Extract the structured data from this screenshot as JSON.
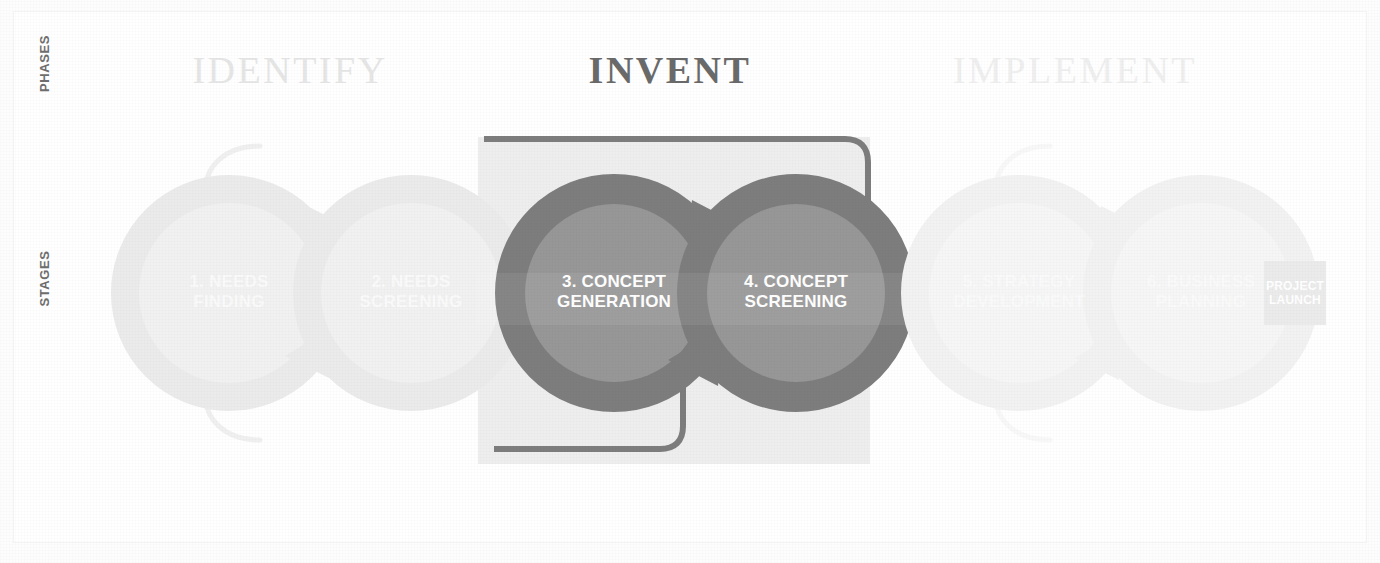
{
  "diagram": {
    "axis_labels": {
      "phases": "PHASES",
      "stages": "STAGES"
    },
    "phases": [
      {
        "id": "identify",
        "title": "IDENTIFY",
        "state": "faded",
        "color": "#e6e6e6"
      },
      {
        "id": "invent",
        "title": "INVENT",
        "state": "highlighted",
        "color": "#6a6a6a",
        "panel_color": "#eeeeee"
      },
      {
        "id": "implement",
        "title": "IMPLEMENT",
        "state": "faded",
        "color": "#efefef"
      }
    ],
    "stages": [
      {
        "number": "1.",
        "line1": "1. NEEDS",
        "line2": "FINDING",
        "phase": "identify",
        "ring_color": "#ebebeb",
        "disc_color": "#f1f1f1"
      },
      {
        "number": "2.",
        "line1": "2. NEEDS",
        "line2": "SCREENING",
        "phase": "identify",
        "ring_color": "#ebebeb",
        "disc_color": "#f1f1f1"
      },
      {
        "number": "3.",
        "line1": "3. CONCEPT",
        "line2": "GENERATION",
        "phase": "invent",
        "ring_color": "#7d7d7d",
        "disc_color": "#979797"
      },
      {
        "number": "4.",
        "line1": "4. CONCEPT",
        "line2": "SCREENING",
        "phase": "invent",
        "ring_color": "#7d7d7d",
        "disc_color": "#979797"
      },
      {
        "number": "5.",
        "line1": "5. STRATEGY",
        "line2": "DEVELOPMENT",
        "phase": "implement",
        "ring_color": "#f2f2f2",
        "disc_color": "#f6f6f6"
      },
      {
        "number": "6.",
        "line1": "6. BUSINESS",
        "line2": "PLANNING",
        "phase": "implement",
        "ring_color": "#f2f2f2",
        "disc_color": "#f6f6f6"
      }
    ],
    "project_launch": {
      "line1": "PROJECT",
      "line2": "LAUNCH",
      "box_color": "#ebebeb",
      "text_color": "#ffffff"
    },
    "connectors": {
      "identify_loop_color": "#f0f0f0",
      "invent_loop_color": "#7d7d7d",
      "implement_loop_color": "#f6f6f6"
    }
  }
}
